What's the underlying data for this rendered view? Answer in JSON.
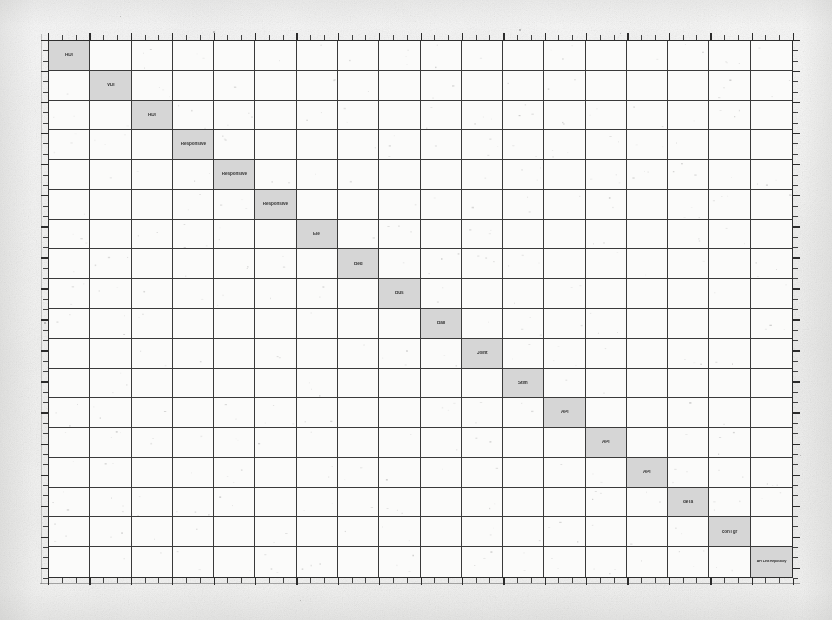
{
  "document": {
    "kind": "scanned-matrix-figure",
    "description": "Photocopied block-diagonal design structure matrix",
    "paper_color": "#f6f6f5",
    "grid_line_color": "#3a3a3a",
    "diagonal_fill_color": "#d6d6d6",
    "text_color": "#1b1b1b"
  },
  "matrix": {
    "rows": 18,
    "columns": 18,
    "diagonal_shaded": true,
    "diagonal_labels": [
      "HDI",
      "VDI",
      "HDI",
      "Responsive",
      "Responsive",
      "Responsive",
      "Ele",
      "Bed",
      "Bus",
      "Ball",
      "Joint",
      "Stim",
      "API",
      "API",
      "API",
      "deTa",
      "conTgr",
      "API Link Repository"
    ],
    "row_indices": [
      1,
      2,
      3,
      4,
      5,
      6,
      7,
      8,
      9,
      10,
      11,
      12,
      13,
      14,
      15,
      16,
      17,
      18
    ],
    "column_indices": [
      1,
      2,
      3,
      4,
      5,
      6,
      7,
      8,
      9,
      10,
      11,
      12,
      13,
      14,
      15,
      16,
      17,
      18
    ]
  },
  "axes": {
    "top": {
      "tick_count": 54,
      "major_every": 3,
      "labels": []
    },
    "bottom": {
      "tick_count": 54,
      "major_every": 3,
      "labels": []
    },
    "left": {
      "tick_count": 52,
      "major_every": 3,
      "labels": []
    },
    "right": {
      "tick_count": 52,
      "major_every": 3,
      "labels": []
    }
  }
}
